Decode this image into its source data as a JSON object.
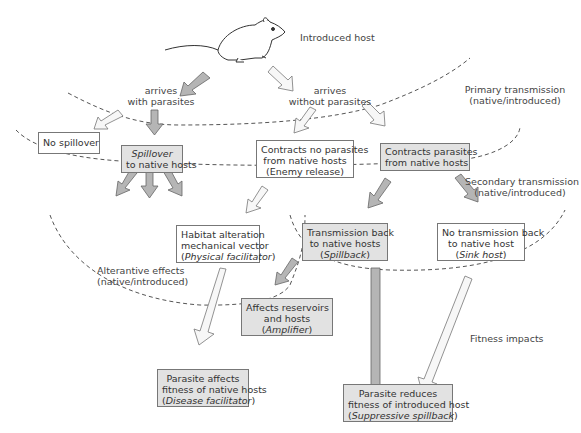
{
  "title": "Introduced host",
  "arrivals": {
    "with_parasites": [
      "arrives",
      "with parasites"
    ],
    "without_parasites": [
      "arrives",
      "without parasites"
    ]
  },
  "zones": {
    "primary": [
      "Primary transmission",
      "(native/introduced)"
    ],
    "secondary": [
      "Secondary transmission",
      "(native/introduced)"
    ],
    "alternative": [
      "Alterantive effects",
      "(native/introduced)"
    ],
    "fitness": "Fitness impacts"
  },
  "boxes": {
    "no_spillover": {
      "line1": "No spillover"
    },
    "spillover": {
      "italic": "Spillover",
      "line2": "to native hosts"
    },
    "enemy_release": {
      "line1": "Contracts no parasites",
      "line2": "from native hosts",
      "line3": "(Enemy release)"
    },
    "contracts": {
      "line1": "Contracts parasites",
      "line2": "from native hosts"
    },
    "physical": {
      "line1": "Habitat alteration",
      "line2": "mechanical vector",
      "italic": "Physical facilitator"
    },
    "spillback": {
      "line1": "Transmission back",
      "line2": "to native hosts",
      "italic": "Spillback"
    },
    "sink": {
      "line1": "No transmission back",
      "line2": "to native host",
      "italic": "Sink host"
    },
    "amplifier": {
      "line1": "Affects reservoirs",
      "line2": "and hosts",
      "italic": "Amplifier"
    },
    "disease_facilitator": {
      "line1": "Parasite affects",
      "line2": "fitness of native hosts",
      "italic": "Disease facilitator"
    },
    "suppressive": {
      "line1": "Parasite reduces",
      "line2": "fitness of introduced host",
      "italic": "Suppressive spillback"
    }
  },
  "colors": {
    "grey_fill": "#e2e2e2",
    "arrow_grey": "#b5b5b5",
    "line": "#555555"
  }
}
